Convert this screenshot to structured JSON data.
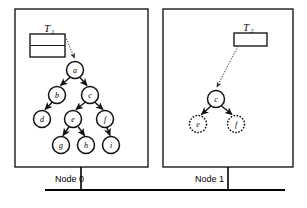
{
  "diagram": {
    "colors": {
      "ink": "#111111",
      "frame": "#1a1a1a",
      "pointer": "#444444",
      "background": "#ffffff"
    },
    "panels": [
      {
        "id": "node0",
        "label": "Node 0",
        "descriptor": {
          "name": "T",
          "subscript": "1",
          "compartments": 2
        },
        "nodes": [
          {
            "id": "a",
            "label": "a",
            "x": 75,
            "y": 70,
            "r": 8.5,
            "style": "solid"
          },
          {
            "id": "b",
            "label": "b",
            "x": 57,
            "y": 95,
            "r": 8.5,
            "style": "solid"
          },
          {
            "id": "c",
            "label": "c",
            "x": 90,
            "y": 95,
            "r": 8.5,
            "style": "solid"
          },
          {
            "id": "d",
            "label": "d",
            "x": 42,
            "y": 119,
            "r": 8.5,
            "style": "solid"
          },
          {
            "id": "e",
            "label": "e",
            "x": 73,
            "y": 119,
            "r": 8.5,
            "style": "solid"
          },
          {
            "id": "f",
            "label": "f",
            "x": 105,
            "y": 119,
            "r": 8.5,
            "style": "solid"
          },
          {
            "id": "g",
            "label": "g",
            "x": 61,
            "y": 145,
            "r": 8.5,
            "style": "solid"
          },
          {
            "id": "h",
            "label": "h",
            "x": 86,
            "y": 145,
            "r": 8.5,
            "style": "solid"
          },
          {
            "id": "i",
            "label": "i",
            "x": 111,
            "y": 145,
            "r": 8.5,
            "style": "solid"
          }
        ],
        "edges": [
          {
            "from": "a",
            "to": "b"
          },
          {
            "from": "a",
            "to": "c"
          },
          {
            "from": "b",
            "to": "d"
          },
          {
            "from": "c",
            "to": "e"
          },
          {
            "from": "c",
            "to": "f"
          },
          {
            "from": "e",
            "to": "g"
          },
          {
            "from": "e",
            "to": "h"
          },
          {
            "from": "f",
            "to": "i"
          }
        ],
        "root": "a"
      },
      {
        "id": "node1",
        "label": "Node 1",
        "descriptor": {
          "name": "T",
          "subscript": "2",
          "compartments": 1
        },
        "nodes": [
          {
            "id": "c",
            "label": "c",
            "x": 216,
            "y": 99,
            "r": 8.5,
            "style": "solid"
          },
          {
            "id": "e",
            "label": "e",
            "x": 198,
            "y": 124,
            "r": 8.5,
            "style": "dashed"
          },
          {
            "id": "f",
            "label": "f",
            "x": 236,
            "y": 124,
            "r": 8.5,
            "style": "dashed"
          }
        ],
        "edges": [
          {
            "from": "c",
            "to": "e"
          },
          {
            "from": "c",
            "to": "f"
          }
        ],
        "root": "c"
      }
    ],
    "bus": {
      "present": true,
      "connector_count": 2
    }
  }
}
